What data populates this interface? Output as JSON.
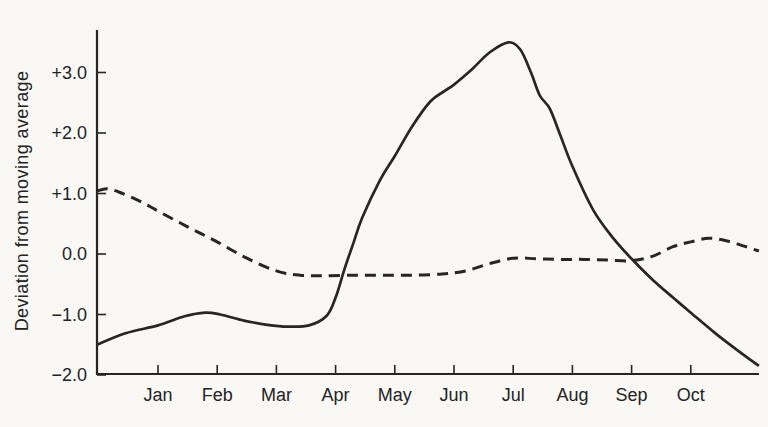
{
  "figure": {
    "background_color": "#f9f8f5",
    "ink_color": "#262622"
  },
  "chart_data": {
    "type": "line",
    "ylabel": "Deviation from moving average",
    "xlabel": "",
    "x_tick_labels": [
      "Jan",
      "Feb",
      "Mar",
      "Apr",
      "May",
      "Jun",
      "Jul",
      "Aug",
      "Sep",
      "Oct"
    ],
    "y_ticks": [
      {
        "value": 3,
        "label": "+3.0"
      },
      {
        "value": 2,
        "label": "+2.0"
      },
      {
        "value": 1,
        "label": "+1.0"
      },
      {
        "value": 0,
        "label": "0.0"
      },
      {
        "value": -1,
        "label": "−1.0"
      },
      {
        "value": -2,
        "label": "−2.0"
      }
    ],
    "ylim": [
      -2.0,
      3.7
    ],
    "xlim_months": [
      -1.03,
      10.15
    ],
    "x_unit": "months, Jan = 0",
    "grid": false,
    "legend": "none",
    "series": [
      {
        "name": "solid-series",
        "style": "solid",
        "points": [
          [
            -1.03,
            -1.5
          ],
          [
            -0.55,
            -1.31
          ],
          [
            0,
            -1.18
          ],
          [
            0.45,
            -1.03
          ],
          [
            0.8,
            -0.97
          ],
          [
            1.05,
            -1.0
          ],
          [
            1.45,
            -1.1
          ],
          [
            1.85,
            -1.17
          ],
          [
            2.2,
            -1.2
          ],
          [
            2.55,
            -1.18
          ],
          [
            2.85,
            -1.02
          ],
          [
            3.0,
            -0.72
          ],
          [
            3.15,
            -0.25
          ],
          [
            3.3,
            0.18
          ],
          [
            3.45,
            0.6
          ],
          [
            3.75,
            1.22
          ],
          [
            4.0,
            1.62
          ],
          [
            4.3,
            2.12
          ],
          [
            4.6,
            2.52
          ],
          [
            4.85,
            2.7
          ],
          [
            5.0,
            2.8
          ],
          [
            5.3,
            3.05
          ],
          [
            5.6,
            3.33
          ],
          [
            5.92,
            3.5
          ],
          [
            6.12,
            3.38
          ],
          [
            6.3,
            3.0
          ],
          [
            6.45,
            2.62
          ],
          [
            6.62,
            2.4
          ],
          [
            6.8,
            1.95
          ],
          [
            7.0,
            1.45
          ],
          [
            7.35,
            0.73
          ],
          [
            7.7,
            0.25
          ],
          [
            8.0,
            -0.08
          ],
          [
            8.35,
            -0.42
          ],
          [
            8.7,
            -0.72
          ],
          [
            9.0,
            -0.97
          ],
          [
            9.4,
            -1.3
          ],
          [
            9.8,
            -1.6
          ],
          [
            10.15,
            -1.85
          ]
        ]
      },
      {
        "name": "dashed-series",
        "style": "dashed",
        "points": [
          [
            -1.03,
            1.04
          ],
          [
            -0.85,
            1.08
          ],
          [
            -0.6,
            1.0
          ],
          [
            -0.3,
            0.87
          ],
          [
            0,
            0.71
          ],
          [
            0.5,
            0.45
          ],
          [
            1.0,
            0.2
          ],
          [
            1.5,
            -0.07
          ],
          [
            2.0,
            -0.28
          ],
          [
            2.4,
            -0.35
          ],
          [
            2.8,
            -0.36
          ],
          [
            3.3,
            -0.35
          ],
          [
            3.8,
            -0.35
          ],
          [
            4.3,
            -0.35
          ],
          [
            4.8,
            -0.33
          ],
          [
            5.2,
            -0.28
          ],
          [
            5.6,
            -0.16
          ],
          [
            6.0,
            -0.07
          ],
          [
            6.4,
            -0.08
          ],
          [
            6.8,
            -0.09
          ],
          [
            7.2,
            -0.09
          ],
          [
            7.6,
            -0.1
          ],
          [
            8.0,
            -0.11
          ],
          [
            8.35,
            -0.04
          ],
          [
            8.7,
            0.12
          ],
          [
            9.0,
            0.2
          ],
          [
            9.3,
            0.26
          ],
          [
            9.6,
            0.22
          ],
          [
            9.9,
            0.13
          ],
          [
            10.15,
            0.05
          ]
        ]
      }
    ]
  }
}
